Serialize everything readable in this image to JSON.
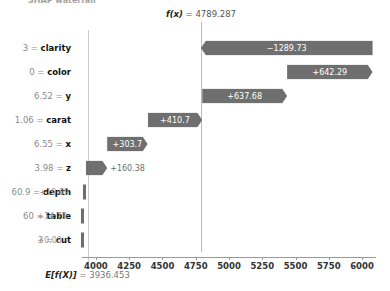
{
  "clipped_title": "SHAP waterfall",
  "chart_data": {
    "type": "bar",
    "chart_kind": "shap-waterfall",
    "title": "",
    "xlabel": "",
    "ylabel": "",
    "xlim": [
      3850,
      6120
    ],
    "grid": false,
    "legend": false,
    "base_value": 3936.453,
    "output_value": 4789.287,
    "base_label_prefix": "E[f(X)]",
    "base_label_value": " = 3936.453",
    "output_label_prefix": "f(x)",
    "output_label_value": " = 4789.287",
    "xticks": [
      4000,
      4250,
      4500,
      4750,
      5000,
      5250,
      5500,
      5750,
      6000
    ],
    "xtick_labels": [
      "4000",
      "4250",
      "4500",
      "4750",
      "5000",
      "5250",
      "5500",
      "5750",
      "6000"
    ],
    "categories": [
      "clarity",
      "color",
      "y",
      "carat",
      "x",
      "z",
      "depth",
      "table",
      "cut"
    ],
    "feature_values": [
      "3",
      "0",
      "6.52",
      "1.06",
      "6.55",
      "3.98",
      "60.9",
      "60",
      "3"
    ],
    "values": [
      -1289.73,
      642.29,
      637.68,
      410.7,
      303.7,
      160.38,
      19.09,
      14.79,
      0.08
    ],
    "value_labels": [
      "−1289.73",
      "+642.29",
      "+637.68",
      "+410.7",
      "+303.7",
      "+160.38",
      "+19.09",
      "+14.79",
      "+0.08"
    ],
    "bar_color": "#6f6f6f"
  },
  "rows": [
    {
      "label_value": "3",
      "label_sep": " = ",
      "label_name": "clarity",
      "value_label": "−1289.73",
      "inside": true
    },
    {
      "label_value": "0",
      "label_sep": " = ",
      "label_name": "color",
      "value_label": "+642.29",
      "inside": true
    },
    {
      "label_value": "6.52",
      "label_sep": " = ",
      "label_name": "y",
      "value_label": "+637.68",
      "inside": true
    },
    {
      "label_value": "1.06",
      "label_sep": " = ",
      "label_name": "carat",
      "value_label": "+410.7",
      "inside": true
    },
    {
      "label_value": "6.55",
      "label_sep": " = ",
      "label_name": "x",
      "value_label": "+303.7",
      "inside": true
    },
    {
      "label_value": "3.98",
      "label_sep": " = ",
      "label_name": "z",
      "value_label": "+160.38",
      "inside": false
    },
    {
      "label_value": "60.9",
      "label_sep": " = ",
      "label_name": "depth",
      "value_label": "+19.09",
      "inside": false
    },
    {
      "label_value": "60",
      "label_sep": " = ",
      "label_name": "table",
      "value_label": "+14.79",
      "inside": false
    },
    {
      "label_value": "3",
      "label_sep": " = ",
      "label_name": "cut",
      "value_label": "+0.08",
      "inside": false
    }
  ]
}
